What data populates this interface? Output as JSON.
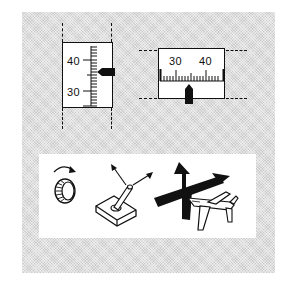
{
  "figure": {
    "vertical_scale": {
      "labels": [
        "40",
        "30"
      ],
      "pointer": "right-side-pointer"
    },
    "horizontal_scale": {
      "labels": [
        "30",
        "40"
      ],
      "pointer": "bottom-pointer"
    },
    "controls": {
      "items": [
        {
          "icon": "rotary-knob-icon"
        },
        {
          "icon": "joystick-icon"
        },
        {
          "icon": "aircraft-axes-icon"
        }
      ]
    }
  },
  "colors": {
    "ink": "#111111",
    "panel": "#dedede",
    "card": "#ffffff"
  }
}
